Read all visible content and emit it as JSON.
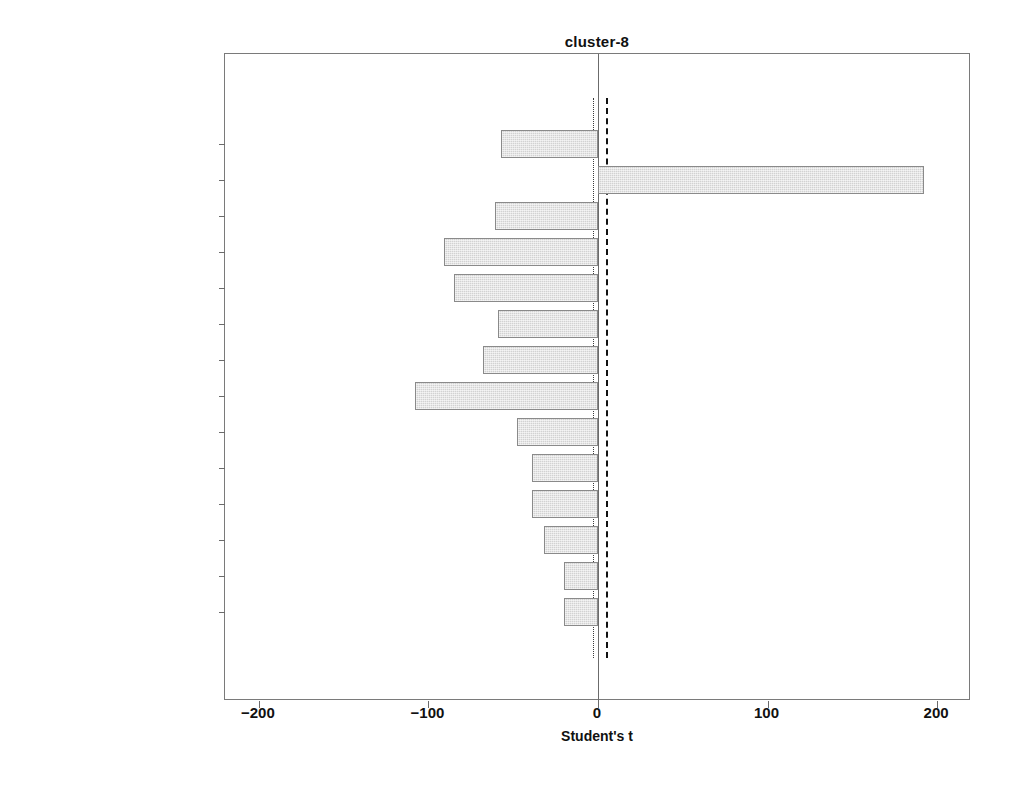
{
  "chart_data": {
    "type": "bar",
    "orientation": "horizontal",
    "title": "cluster-8",
    "xlabel": "Student's t",
    "ylabel": "",
    "xlim": [
      -220,
      220
    ],
    "xticks": [
      -200,
      -100,
      0,
      100,
      200
    ],
    "xtick_labels": [
      "−200",
      "−100",
      "0",
      "100",
      "200"
    ],
    "grid": false,
    "legend": null,
    "categories": [
      "PRC ACCESSORIES",
      "PRC APPLIANCES",
      "PRC CULTURE",
      "PRC APPAREL",
      "PRC FOOD",
      "PRC HEALTH",
      "PRC TELCOS",
      "PRC TRAVEL",
      "PRC HOME GARDEN",
      "PRC GAS",
      "PRC ENTERTAINMENT",
      "PRC BOOKS MUSIC",
      "PRC FITNESS",
      "PRC EDUCATION"
    ],
    "values": [
      -57,
      192,
      -61,
      -91,
      -85,
      -59,
      -68,
      -108,
      -48,
      -39,
      -39,
      -32,
      -20,
      -20
    ],
    "reference_lines": [
      {
        "name": "lower-threshold",
        "value": -3,
        "style": "dotted"
      },
      {
        "name": "upper-threshold",
        "value": 5,
        "style": "dashed"
      },
      {
        "name": "zero",
        "value": 0,
        "style": "solid"
      }
    ],
    "bar_fill_color": "#d2d2d2",
    "bar_edge_color": "#8a8a8a",
    "axis_color": "#7a7a7a"
  }
}
